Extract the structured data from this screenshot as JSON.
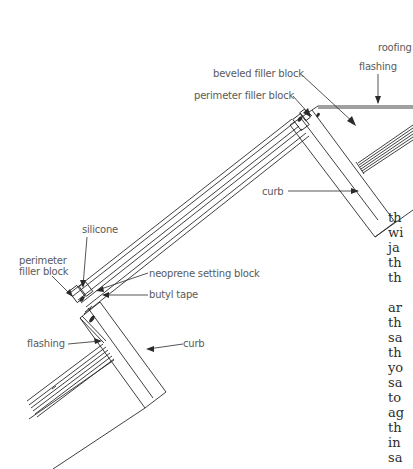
{
  "labels": {
    "roofing": "roofing",
    "flashing_top": "flashing",
    "beveled_filler_block": "beveled filler block",
    "perimeter_filler_block_top": "perimeter filler block",
    "curb_top": "curb",
    "silicone": "silicone",
    "perimeter_filler_block_bottom_line1": "perimeter",
    "perimeter_filler_block_bottom_line2": "filler block",
    "neoprene_setting_block": "neoprene setting block",
    "butyl_tape": "butyl tape",
    "flashing_bottom": "flashing",
    "curb_bottom": "curb"
  },
  "body_text": {
    "paragraph1": [
      "th",
      "wi",
      "ja",
      "th",
      "th"
    ],
    "paragraph2": [
      "ar",
      "th",
      "sa",
      "th",
      "yo",
      "sa",
      "to",
      "ag",
      "th",
      "in",
      "sa"
    ]
  },
  "colors": {
    "line": "#2a2a2a",
    "label": "#5a5a5a",
    "text": "#2e2e2e"
  }
}
